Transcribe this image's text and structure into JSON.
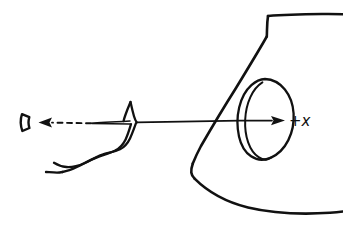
{
  "diagram": {
    "background_color": "#ffffff",
    "ink_color": "#111111",
    "canvas": {
      "width": 343,
      "height": 234
    },
    "labels": {
      "axis_positive_x": "+x"
    },
    "elements": [
      {
        "name": "body-outline",
        "description": "Large hand-drawn housing body occupying the right side: flat top edge running to the right border, a step down at the left, a long straight edge sloping down-left, a corner near the lower left, and a gently curved bottom edge running to the right border"
      },
      {
        "name": "port-ellipse-outer",
        "description": "Outer ellipse of the port / nozzle opening on the body"
      },
      {
        "name": "port-ellipse-inner",
        "description": "Inner ellipse forming the rim thickness of the port"
      },
      {
        "name": "axis-arrow",
        "description": "Solid horizontal line crossing the body with an arrowhead pointing right, labeled +x"
      },
      {
        "name": "crack-line",
        "description": "Double zigzag hand-drawn crack running down-left from the axis vertex"
      },
      {
        "name": "dashed-arrow",
        "description": "Dashed leader line with a solid arrowhead pointing left toward the small conical object"
      },
      {
        "name": "cone-object",
        "description": "Small hollow cone / tack-head shape at the far left end of the dashed arrow"
      }
    ]
  }
}
